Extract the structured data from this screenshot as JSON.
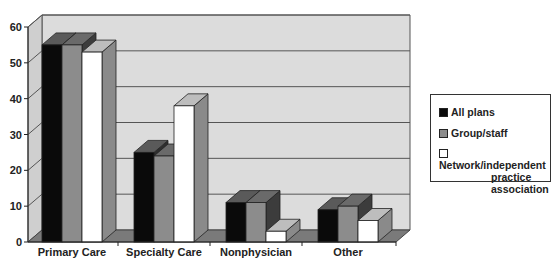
{
  "chart_data": {
    "type": "bar",
    "title": "",
    "xlabel": "",
    "ylabel": "",
    "ylim": [
      0,
      60
    ],
    "yticks": [
      0,
      10,
      20,
      30,
      40,
      50,
      60
    ],
    "grid": true,
    "legend_position": "right",
    "three_d": true,
    "categories": [
      "Primary Care",
      "Specialty Care",
      "Nonphysician",
      "Other"
    ],
    "series": [
      {
        "name": "All plans",
        "color": "#0a0a0a",
        "values": [
          55,
          25,
          11,
          9
        ]
      },
      {
        "name": "Group/staff",
        "color": "#8c8c8c",
        "values": [
          55,
          24,
          11,
          10
        ]
      },
      {
        "name": "Network/independent practice association",
        "color": "#ffffff",
        "values": [
          53,
          38,
          3,
          6
        ]
      }
    ]
  },
  "legend": {
    "items": [
      {
        "label": "All plans"
      },
      {
        "label_line1": "Network/independent",
        "label_line2": "practice",
        "label_line3": "association"
      },
      {
        "label": "Group/staff"
      }
    ]
  },
  "axis": {
    "y_labels": [
      "0",
      "10",
      "20",
      "30",
      "40",
      "50",
      "60"
    ]
  }
}
